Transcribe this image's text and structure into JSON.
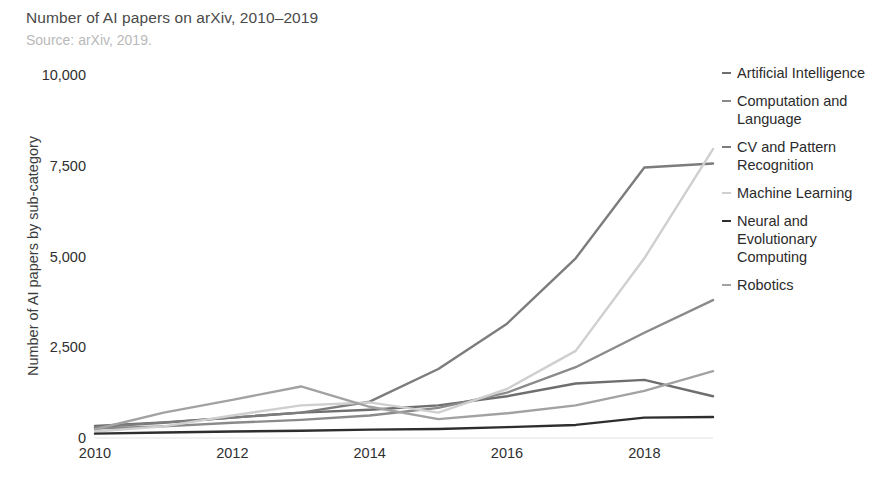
{
  "header": {
    "title": "Number of AI papers on arXiv, 2010–2019",
    "subtitle": "Source: arXiv, 2019."
  },
  "axes": {
    "ylabel": "Number of AI papers by sub-category",
    "yticks": [
      "0",
      "2,500",
      "5,000",
      "7,500",
      "10,000"
    ],
    "xticks": [
      "2010",
      "2012",
      "2014",
      "2016",
      "2018"
    ]
  },
  "legend": {
    "items": [
      {
        "label": "Artificial Intelligence",
        "color": "#6e6e6e"
      },
      {
        "label": "Computation and Language",
        "color": "#8a8a8a"
      },
      {
        "label": "CV and Pattern Recognition",
        "color": "#7c7c7c"
      },
      {
        "label": "Machine Learning",
        "color": "#cfcfcf"
      },
      {
        "label": "Neural and Evolutionary Computing",
        "color": "#2e2e2e"
      },
      {
        "label": "Robotics",
        "color": "#a2a2a2"
      }
    ]
  },
  "chart_data": {
    "type": "line",
    "title": "Number of AI papers on arXiv, 2010–2019",
    "subtitle": "Source: arXiv, 2019.",
    "xlabel": "",
    "ylabel": "Number of AI papers by sub-category",
    "x": [
      2010,
      2011,
      2012,
      2013,
      2014,
      2015,
      2016,
      2017,
      2018,
      2019
    ],
    "xlim": [
      2010,
      2019
    ],
    "ylim": [
      0,
      10000
    ],
    "yticks": [
      0,
      2500,
      5000,
      7500,
      10000
    ],
    "xticks": [
      2010,
      2012,
      2014,
      2016,
      2018
    ],
    "grid": false,
    "legend_position": "right",
    "series": [
      {
        "name": "Artificial Intelligence",
        "color": "#6e6e6e",
        "values": [
          330,
          430,
          560,
          700,
          780,
          900,
          1150,
          1500,
          1600,
          1150
        ]
      },
      {
        "name": "Computation and Language",
        "color": "#8a8a8a",
        "values": [
          260,
          320,
          420,
          500,
          620,
          830,
          1250,
          1950,
          2900,
          3800
        ]
      },
      {
        "name": "CV and Pattern Recognition",
        "color": "#7c7c7c",
        "values": [
          300,
          420,
          560,
          700,
          1000,
          1900,
          3150,
          4950,
          7450,
          7560
        ]
      },
      {
        "name": "Machine Learning",
        "color": "#cfcfcf",
        "values": [
          180,
          320,
          620,
          900,
          980,
          700,
          1350,
          2400,
          4950,
          7960
        ]
      },
      {
        "name": "Neural and Evolutionary Computing",
        "color": "#2e2e2e",
        "values": [
          120,
          150,
          180,
          200,
          230,
          250,
          300,
          360,
          560,
          580
        ]
      },
      {
        "name": "Robotics",
        "color": "#a2a2a2",
        "values": [
          240,
          700,
          1050,
          1420,
          860,
          520,
          680,
          900,
          1300,
          1840
        ]
      }
    ]
  }
}
